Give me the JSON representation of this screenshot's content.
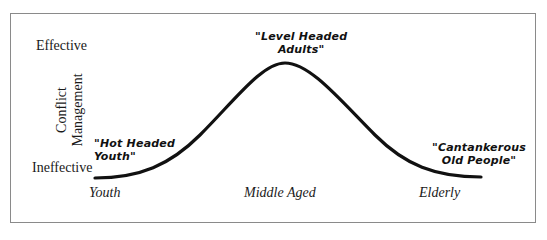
{
  "diagram": {
    "y_axis": {
      "title_line1": "Conflict",
      "title_line2": "Management",
      "high_label": "Effective",
      "low_label": "Ineffective"
    },
    "x_axis": {
      "labels": [
        "Youth",
        "Middle Aged",
        "Elderly"
      ]
    },
    "annotations": {
      "youth": {
        "line1": "\"Hot Headed",
        "line2": "Youth\""
      },
      "adults": {
        "line1": "\"Level Headed",
        "line2": "Adults\""
      },
      "elderly": {
        "line1": "\"Cantankerous",
        "line2": "Old People\""
      }
    },
    "curve": {
      "shape": "bell",
      "stroke_color": "#111111",
      "points": [
        {
          "stage": "Youth",
          "level": "Ineffective"
        },
        {
          "stage": "Middle Aged",
          "level": "Effective"
        },
        {
          "stage": "Elderly",
          "level": "Ineffective"
        }
      ]
    },
    "colors": {
      "border": "#8a8a8a",
      "text": "#1a1a1a",
      "background": "#ffffff"
    }
  }
}
